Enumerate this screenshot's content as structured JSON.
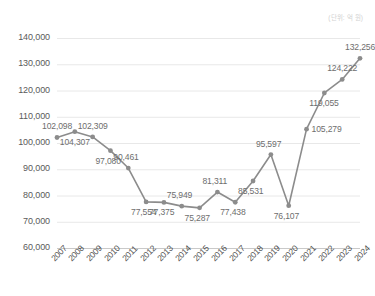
{
  "unit_note": "(단위: 억 원)",
  "chart_data": {
    "type": "line",
    "title": "",
    "subtitle": "",
    "xlabel": "",
    "ylabel": "",
    "unit_note": "(단위: 억 원)",
    "grid": true,
    "legend": false,
    "legend_position": "none",
    "line_color": "#8c8c8c",
    "marker_color": "#8c8c8c",
    "label_color": "#6e6e6e",
    "gridline_color": "#e8e8e8",
    "ylim": [
      60000,
      140000
    ],
    "yticks": [
      60000,
      70000,
      80000,
      90000,
      100000,
      110000,
      120000,
      130000,
      140000
    ],
    "ytick_labels": [
      "60,000",
      "70,000",
      "80,000",
      "90,000",
      "100,000",
      "110,000",
      "120,000",
      "130,000",
      "140,000"
    ],
    "categories": [
      "2007",
      "2008",
      "2009",
      "2010",
      "2011",
      "2012",
      "2013",
      "2014",
      "2015",
      "2016",
      "2017",
      "2018",
      "2019",
      "2020",
      "2021",
      "2022",
      "2023",
      "2024"
    ],
    "values": [
      102098,
      104307,
      102309,
      97080,
      90461,
      77554,
      77375,
      75949,
      75287,
      81311,
      77438,
      85531,
      95597,
      76107,
      105279,
      119055,
      124222,
      132256
    ],
    "data_labels": [
      "102,098",
      "104,307",
      "102,309",
      "97,080",
      "90,461",
      "77,554",
      "77,375",
      "75,949",
      "75,287",
      "81,311",
      "77,438",
      "85,531",
      "95,597",
      "76,107",
      "105,279",
      "119,055",
      "124,222",
      "132,256"
    ],
    "label_positions": [
      "above",
      "below",
      "above",
      "below",
      "above",
      "below",
      "below",
      "above",
      "below",
      "above",
      "below",
      "below",
      "above",
      "below",
      "right",
      "below",
      "above",
      "above"
    ]
  }
}
